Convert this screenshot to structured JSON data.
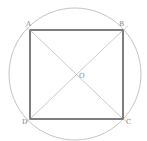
{
  "diagram": {
    "circle": {
      "cx": 75,
      "cy": 74,
      "r": 66,
      "color": "#b0b0b0"
    },
    "square": {
      "color": "#333333"
    },
    "diagonal_color": "#b8b8b8",
    "points": {
      "A": {
        "label": "A",
        "x": 30,
        "y": 30
      },
      "B": {
        "label": "B",
        "x": 123,
        "y": 30
      },
      "C": {
        "label": "C",
        "x": 123,
        "y": 119
      },
      "D": {
        "label": "D",
        "x": 30,
        "y": 119
      },
      "O": {
        "label": "O",
        "x": 76,
        "y": 74
      }
    }
  }
}
